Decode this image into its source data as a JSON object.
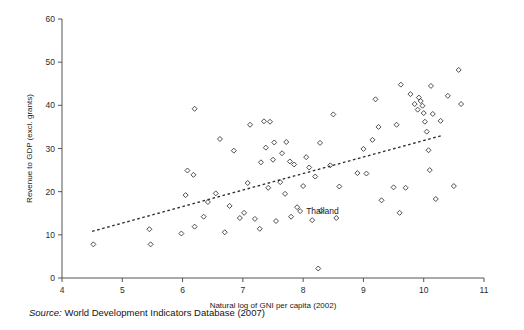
{
  "figure": {
    "source_prefix": "Source:",
    "source_text": "World Development Indicators Database (2007)",
    "point_label": "Thailand"
  },
  "chart_data": {
    "type": "scatter",
    "title": "",
    "xlabel": "Natural log of GNI per capita (2002)",
    "ylabel": "Revenue to GDP (excl. grants)",
    "xlim": [
      4,
      11
    ],
    "ylim": [
      0,
      60
    ],
    "xticks": [
      4,
      5,
      6,
      7,
      8,
      9,
      10,
      11
    ],
    "yticks": [
      0,
      10,
      20,
      30,
      40,
      50,
      60
    ],
    "grid": false,
    "legend": "none",
    "marker_style": "open-diamond",
    "annotations": [
      {
        "label": "Thailand",
        "x": 7.95,
        "y": 15.5,
        "label_side": "right"
      }
    ],
    "trendline": {
      "style": "dotted",
      "x": [
        4.5,
        10.3
      ],
      "y": [
        10.8,
        33.0
      ]
    },
    "points": [
      {
        "x": 4.52,
        "y": 7.8
      },
      {
        "x": 5.45,
        "y": 11.3
      },
      {
        "x": 5.47,
        "y": 7.8
      },
      {
        "x": 5.98,
        "y": 10.3
      },
      {
        "x": 6.05,
        "y": 19.2
      },
      {
        "x": 6.08,
        "y": 24.9
      },
      {
        "x": 6.18,
        "y": 23.9
      },
      {
        "x": 6.2,
        "y": 39.2
      },
      {
        "x": 6.2,
        "y": 11.9
      },
      {
        "x": 6.35,
        "y": 14.2
      },
      {
        "x": 6.42,
        "y": 17.6
      },
      {
        "x": 6.55,
        "y": 19.6
      },
      {
        "x": 6.62,
        "y": 32.2
      },
      {
        "x": 6.7,
        "y": 10.6
      },
      {
        "x": 6.78,
        "y": 16.7
      },
      {
        "x": 6.85,
        "y": 29.5
      },
      {
        "x": 6.95,
        "y": 13.9
      },
      {
        "x": 7.02,
        "y": 15.1
      },
      {
        "x": 7.08,
        "y": 22.0
      },
      {
        "x": 7.12,
        "y": 35.5
      },
      {
        "x": 7.2,
        "y": 13.7
      },
      {
        "x": 7.28,
        "y": 11.4
      },
      {
        "x": 7.3,
        "y": 26.8
      },
      {
        "x": 7.35,
        "y": 36.3
      },
      {
        "x": 7.38,
        "y": 30.2
      },
      {
        "x": 7.42,
        "y": 20.9
      },
      {
        "x": 7.45,
        "y": 36.2
      },
      {
        "x": 7.5,
        "y": 27.4
      },
      {
        "x": 7.52,
        "y": 31.4
      },
      {
        "x": 7.55,
        "y": 13.2
      },
      {
        "x": 7.62,
        "y": 22.2
      },
      {
        "x": 7.65,
        "y": 28.9
      },
      {
        "x": 7.7,
        "y": 19.5
      },
      {
        "x": 7.72,
        "y": 31.5
      },
      {
        "x": 7.78,
        "y": 27.0
      },
      {
        "x": 7.8,
        "y": 14.2
      },
      {
        "x": 7.85,
        "y": 26.3
      },
      {
        "x": 7.9,
        "y": 16.4
      },
      {
        "x": 7.95,
        "y": 15.5
      },
      {
        "x": 8.0,
        "y": 21.3
      },
      {
        "x": 8.05,
        "y": 28.0
      },
      {
        "x": 8.1,
        "y": 25.6
      },
      {
        "x": 8.15,
        "y": 13.4
      },
      {
        "x": 8.2,
        "y": 23.5
      },
      {
        "x": 8.25,
        "y": 2.2
      },
      {
        "x": 8.28,
        "y": 31.3
      },
      {
        "x": 8.3,
        "y": 15.6
      },
      {
        "x": 8.45,
        "y": 26.1
      },
      {
        "x": 8.5,
        "y": 37.9
      },
      {
        "x": 8.55,
        "y": 13.9
      },
      {
        "x": 8.6,
        "y": 21.2
      },
      {
        "x": 8.9,
        "y": 24.3
      },
      {
        "x": 9.0,
        "y": 29.9
      },
      {
        "x": 9.05,
        "y": 24.2
      },
      {
        "x": 9.15,
        "y": 32.0
      },
      {
        "x": 9.2,
        "y": 41.4
      },
      {
        "x": 9.25,
        "y": 35.0
      },
      {
        "x": 9.3,
        "y": 18.0
      },
      {
        "x": 9.5,
        "y": 21.0
      },
      {
        "x": 9.55,
        "y": 35.5
      },
      {
        "x": 9.6,
        "y": 15.1
      },
      {
        "x": 9.62,
        "y": 44.8
      },
      {
        "x": 9.7,
        "y": 20.9
      },
      {
        "x": 9.78,
        "y": 42.6
      },
      {
        "x": 9.85,
        "y": 40.3
      },
      {
        "x": 9.9,
        "y": 39.0
      },
      {
        "x": 9.92,
        "y": 41.8
      },
      {
        "x": 9.95,
        "y": 41.0
      },
      {
        "x": 9.98,
        "y": 39.9
      },
      {
        "x": 10.0,
        "y": 38.2
      },
      {
        "x": 10.02,
        "y": 36.2
      },
      {
        "x": 10.05,
        "y": 33.9
      },
      {
        "x": 10.08,
        "y": 29.6
      },
      {
        "x": 10.1,
        "y": 25.0
      },
      {
        "x": 10.12,
        "y": 44.5
      },
      {
        "x": 10.15,
        "y": 38.0
      },
      {
        "x": 10.2,
        "y": 18.3
      },
      {
        "x": 10.28,
        "y": 36.4
      },
      {
        "x": 10.4,
        "y": 42.2
      },
      {
        "x": 10.5,
        "y": 21.3
      },
      {
        "x": 10.58,
        "y": 48.2
      },
      {
        "x": 10.62,
        "y": 40.3
      }
    ]
  }
}
